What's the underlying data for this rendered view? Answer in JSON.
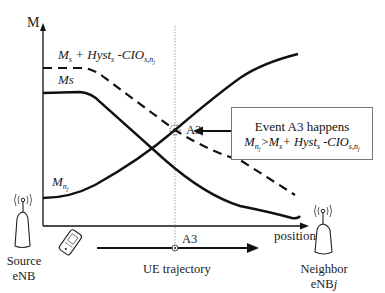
{
  "diagram": {
    "y_axis_label": "M",
    "x_axis_label": "position",
    "curves": {
      "threshold": {
        "label_base": "M",
        "label_sub_s": "s",
        "label_mid": " + Hyst",
        "label_sub_hyst": "s",
        "label_cio": " -CIO",
        "label_sub_cio": "s,n",
        "label_sub_cio_j": "j",
        "style": "dashed"
      },
      "serving": {
        "label": "Ms",
        "style": "solid"
      },
      "neighbor": {
        "label_base": "M",
        "label_sub": "n",
        "label_sub_j": "j",
        "style": "solid"
      }
    },
    "intersection_label": "A3",
    "event_box": {
      "line1": "Event A3 happens",
      "line2_m": "M",
      "line2_sub_n": "n",
      "line2_sub_j": "j",
      "line2_gt": ">M",
      "line2_sub_s": "s",
      "line2_mid": "+ Hyst",
      "line2_sub_hyst": "s",
      "line2_cio": " -CIO",
      "line2_sub_cio": "s,n",
      "line2_sub_cio_j": "j"
    },
    "trajectory": {
      "marker_label": "A3",
      "label": "UE trajectory"
    },
    "source_enb": {
      "line1": "Source",
      "line2": "eNB"
    },
    "neighbor_enb": {
      "line1": "Neighbor",
      "line2": "eNB",
      "line2_italic": "j"
    },
    "colors": {
      "line": "#111111",
      "box_border": "#777777",
      "dotted": "#888888"
    }
  }
}
